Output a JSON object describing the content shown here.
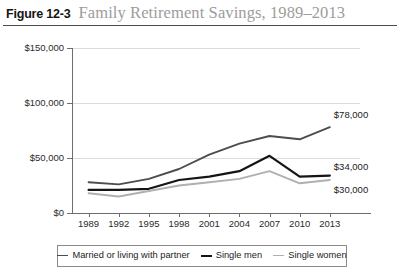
{
  "figure": {
    "number": "Figure 12-3",
    "title": "Family Retirement Savings, 1989–2013"
  },
  "chart_data": {
    "type": "line",
    "title": "Family Retirement Savings, 1989–2013",
    "xlabel": "",
    "ylabel": "",
    "x": [
      "1989",
      "1992",
      "1995",
      "1998",
      "2001",
      "2004",
      "2007",
      "2010",
      "2013"
    ],
    "categories": [
      "1989",
      "1992",
      "1995",
      "1998",
      "2001",
      "2004",
      "2007",
      "2010",
      "2013"
    ],
    "ylim": [
      0,
      150000
    ],
    "yticks": [
      0,
      50000,
      100000,
      150000
    ],
    "ytick_labels": [
      "$0",
      "$50,000",
      "$100,000",
      "$150,000"
    ],
    "grid": true,
    "legend_position": "bottom",
    "series": [
      {
        "name": "Married or living with partner",
        "color": "#4d4d4d",
        "width": 1.9,
        "values": [
          28000,
          26000,
          31000,
          40000,
          53000,
          63000,
          70000,
          67000,
          78000
        ],
        "end_label": "$78,000"
      },
      {
        "name": "Single men",
        "color": "#151515",
        "width": 2.2,
        "values": [
          21000,
          21000,
          22000,
          30000,
          33000,
          38000,
          52000,
          33000,
          34000
        ],
        "end_label": "$34,000"
      },
      {
        "name": "Single women",
        "color": "#b0b0b0",
        "width": 1.9,
        "values": [
          18000,
          15000,
          20000,
          25000,
          28000,
          31000,
          38000,
          27000,
          30000
        ],
        "end_label": "$30,000"
      }
    ]
  }
}
